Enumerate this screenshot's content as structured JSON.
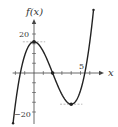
{
  "chart_data": {
    "type": "line",
    "title": "",
    "xlabel": "x",
    "ylabel": "f(x)",
    "xlim": [
      -2.3,
      6.8
    ],
    "ylim": [
      -24,
      27
    ],
    "x_tick_step": 1,
    "y_tick_step": 5,
    "x_tick_labels": [
      {
        "value": 5,
        "label": "5"
      }
    ],
    "y_tick_labels": [
      {
        "value": 20,
        "label": "20"
      },
      {
        "value": -20,
        "label": "−20"
      }
    ],
    "grid": false,
    "legend": null,
    "series": [
      {
        "name": "f(x)",
        "formula": "x^3 - 6x^2 + 16",
        "x_range": [
          -2.25,
          6.4
        ],
        "color": "#222222"
      }
    ],
    "key_points": [
      {
        "name": "local-max",
        "x": 0,
        "y": 16
      },
      {
        "name": "x-intercept",
        "x": 2,
        "y": 0
      },
      {
        "name": "local-min",
        "x": 4,
        "y": -16
      }
    ],
    "reference_lines": [
      {
        "name": "max-dashed",
        "y": 16,
        "x_from": -1.2,
        "x_to": 1.2
      },
      {
        "name": "min-dashed",
        "y": -16,
        "x_from": 2.8,
        "x_to": 5.2
      }
    ]
  },
  "labels": {
    "y_axis": "f(x)",
    "x_axis": "x",
    "tick_20": "20",
    "tick_neg20": "−20",
    "tick_5": "5"
  },
  "colors": {
    "curve": "#222222",
    "axis": "#444444",
    "dashed": "#888888"
  }
}
